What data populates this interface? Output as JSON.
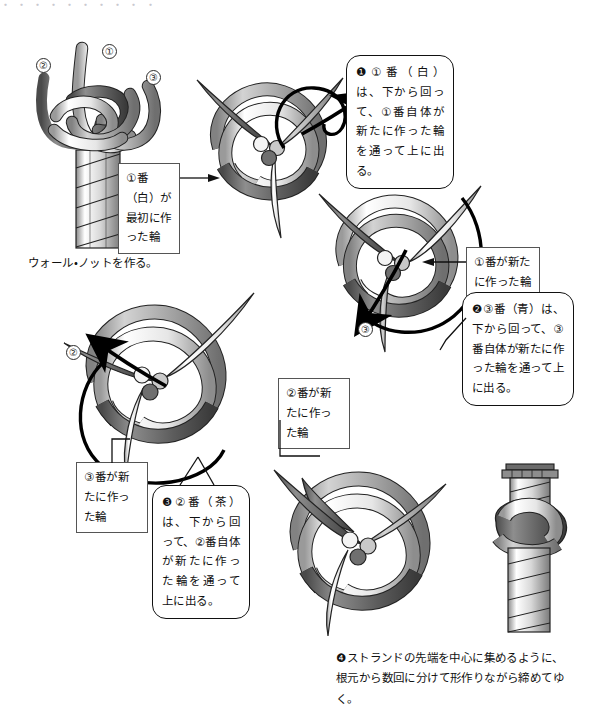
{
  "document": {
    "title": "マシュー・ウォーカー・ノットの結び方",
    "cropped_top_line": "・ ・ ・ ・ ・ ・ ・ ・ ・ ・"
  },
  "colors": {
    "ink": "#111111",
    "box_border": "#555555",
    "rope_dark": "#5f5f5f",
    "rope_mid": "#a9a9a9",
    "rope_light": "#f2f2f2",
    "background": "#ffffff"
  },
  "strand_labels": {
    "one": "①",
    "two": "②",
    "three": "③"
  },
  "figures": [
    {
      "id": "figure-wall-knot",
      "name": "wall-knot-start",
      "caption": "ウォール・ノットを作る。",
      "strand_markers": [
        "②",
        "①",
        "③"
      ]
    },
    {
      "id": "figure-step-1",
      "name": "step-one-white-strand",
      "strand_markers": []
    },
    {
      "id": "figure-step-2",
      "name": "step-two-blue-strand",
      "strand_markers": [
        "③"
      ]
    },
    {
      "id": "figure-step-3",
      "name": "step-three-brown-strand",
      "strand_markers": [
        "②"
      ]
    },
    {
      "id": "figure-step-4",
      "name": "step-four-loose-knot",
      "strand_markers": []
    },
    {
      "id": "figure-finished",
      "name": "finished-tightened-knot",
      "strand_markers": []
    }
  ],
  "callouts": {
    "step1": {
      "marker": "❶",
      "text": "❶①番（白）は、下から回って、①番自体が新たに作った輪を通って上に出る。"
    },
    "step2": {
      "marker": "❷",
      "text": "❷③番（青）は、下から回って、③番自体が新たに作った輪を通って上に出る。"
    },
    "step3": {
      "marker": "❸",
      "text": "❸②番（茶）は、下から回って、②番自体が新たに作った輪を通って上に出る。"
    },
    "step4": {
      "marker": "❹",
      "text": "❹ストランドの先端を中心に集めるように、根元から数回に分けて形作りながら締めてゆく。"
    }
  },
  "label_boxes": {
    "first_loop_white": "①番（白）が最初に作った輪",
    "new_loop_one": "①番が新たに作った輪",
    "new_loop_two": "②番が新たに作った輪",
    "new_loop_three": "③番が新たに作った輪"
  },
  "captions": {
    "wall_knot": "ウォール・ノットを作る。"
  }
}
